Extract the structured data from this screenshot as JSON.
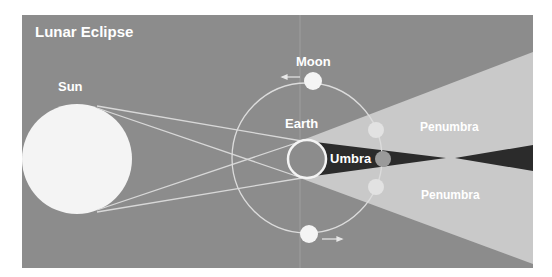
{
  "title": "Lunar Eclipse",
  "labels": {
    "sun": "Sun",
    "moon": "Moon",
    "earth": "Earth",
    "umbra": "Umbra",
    "penumbra_upper": "Penumbra",
    "penumbra_lower": "Penumbra"
  },
  "colors": {
    "background": "#8c8c8c",
    "penumbra": "#c9c9c9",
    "umbra": "#2b2b2b",
    "bodies": "#f4f4f4",
    "lines": "#d8d8d8",
    "eclipsed_moon": "#9a9a9a"
  }
}
